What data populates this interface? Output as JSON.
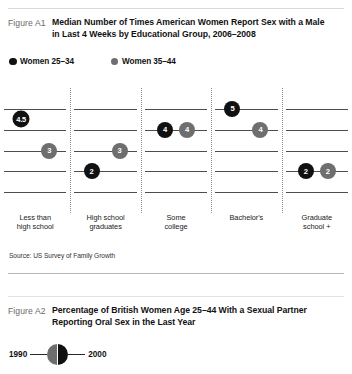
{
  "colors": {
    "series_young": "#111111",
    "series_older": "#6e6e6e",
    "gridline": "#4d4d4d",
    "divider": "#8a8a8a",
    "rule": "#b5b5b5"
  },
  "figure_a1": {
    "number": "Figure A1",
    "title_line1": "Median Number of Times American Women Report Sex with a Male",
    "title_line2": "in Last 4 Weeks by Educational Group, 2006–2008",
    "legend": [
      {
        "label": "Women 25–34",
        "color": "#111111",
        "name": "women-25-34"
      },
      {
        "label": "Women 35–44",
        "color": "#6e6e6e",
        "name": "women-35-44"
      }
    ],
    "source": "Source:  US Survey of Family Growth"
  },
  "figure_a2": {
    "number": "Figure A2",
    "title_line1": "Percentage of British Women Age 25–44 With a Sexual Partner",
    "title_line2": "Reporting Oral Sex in the Last Year",
    "legend": {
      "left_label": "1990",
      "right_label": "2000",
      "left_color": "#6e6e6e",
      "right_color": "#111111"
    }
  },
  "chart_data": {
    "type": "scatter",
    "title": "Median Number of Times American Women Report Sex with a Male in Last 4 Weeks by Educational Group, 2006–2008",
    "xlabel": "",
    "ylabel": "Median number of times",
    "ylim": [
      0,
      6
    ],
    "grid": true,
    "gridlines": [
      5,
      4,
      3,
      2,
      1
    ],
    "legend_position": "top-left",
    "categories": [
      "Less than high school",
      "High school graduates",
      "Some college",
      "Bachelor's",
      "Graduate school +"
    ],
    "category_labels": [
      {
        "l1": "Less than",
        "l2": "high school"
      },
      {
        "l1": "High school",
        "l2": "graduates"
      },
      {
        "l1": "Some",
        "l2": "college"
      },
      {
        "l1": "Bachelor's",
        "l2": ""
      },
      {
        "l1": "Graduate",
        "l2": "school +"
      }
    ],
    "series": [
      {
        "name": "Women 25–34",
        "color": "#111111",
        "values": [
          4.5,
          2,
          4,
          5,
          2
        ],
        "labels": [
          "4.5",
          "2",
          "4",
          "5",
          "2"
        ]
      },
      {
        "name": "Women 35–44",
        "color": "#6e6e6e",
        "values": [
          3,
          3,
          4,
          4,
          2
        ],
        "labels": [
          "3",
          "3",
          "4",
          "4",
          "2"
        ]
      }
    ]
  }
}
